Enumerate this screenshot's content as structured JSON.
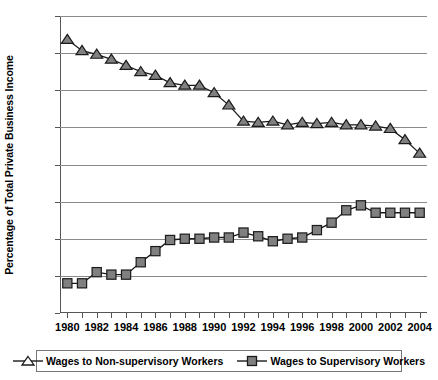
{
  "chart_data": {
    "type": "line",
    "title": "",
    "xlabel": "",
    "ylabel": "Percentage of Total Private Business Income",
    "x": [
      1980,
      1981,
      1982,
      1983,
      1984,
      1985,
      1986,
      1987,
      1988,
      1989,
      1990,
      1991,
      1992,
      1993,
      1994,
      1995,
      1996,
      1997,
      1998,
      1999,
      2000,
      2001,
      2002,
      2003,
      2004
    ],
    "xlim": [
      1979.5,
      2004.5
    ],
    "ylim": [
      14,
      38
    ],
    "ytick_labels": [
      "14%",
      "17%",
      "20%",
      "23%",
      "26%",
      "29%",
      "32%",
      "35%",
      "38%"
    ],
    "ytick_values": [
      14,
      17,
      20,
      23,
      26,
      29,
      32,
      35,
      38
    ],
    "xtick_labels": [
      "1980",
      "1982",
      "1984",
      "1986",
      "1988",
      "1990",
      "1992",
      "1994",
      "1996",
      "1998",
      "2000",
      "2002",
      "2004"
    ],
    "xtick_values": [
      1980,
      1982,
      1984,
      1986,
      1988,
      1990,
      1992,
      1994,
      1996,
      1998,
      2000,
      2002,
      2004
    ],
    "grid": true,
    "legend_position": "bottom",
    "series": [
      {
        "name": "Wages to Non-supervisory Workers",
        "marker": "triangle",
        "color": "#808080",
        "values": [
          36.1,
          35.2,
          34.9,
          34.5,
          34.0,
          33.5,
          33.2,
          32.6,
          32.4,
          32.4,
          31.8,
          30.8,
          29.5,
          29.4,
          29.5,
          29.2,
          29.4,
          29.3,
          29.4,
          29.2,
          29.2,
          29.1,
          28.9,
          28.0,
          26.9
        ]
      },
      {
        "name": "Wages to Supervisory Workers",
        "marker": "square",
        "color": "#808080",
        "values": [
          16.4,
          16.4,
          17.3,
          17.1,
          17.1,
          18.1,
          19.0,
          19.9,
          20.0,
          20.0,
          20.1,
          20.1,
          20.5,
          20.2,
          19.8,
          20.0,
          20.1,
          20.7,
          21.3,
          22.3,
          22.7,
          22.1,
          22.1,
          22.1,
          22.1
        ]
      }
    ]
  },
  "legend": {
    "entries": [
      {
        "label": "Wages to Non-supervisory Workers"
      },
      {
        "label": "Wages to Supervisory Workers"
      }
    ]
  }
}
